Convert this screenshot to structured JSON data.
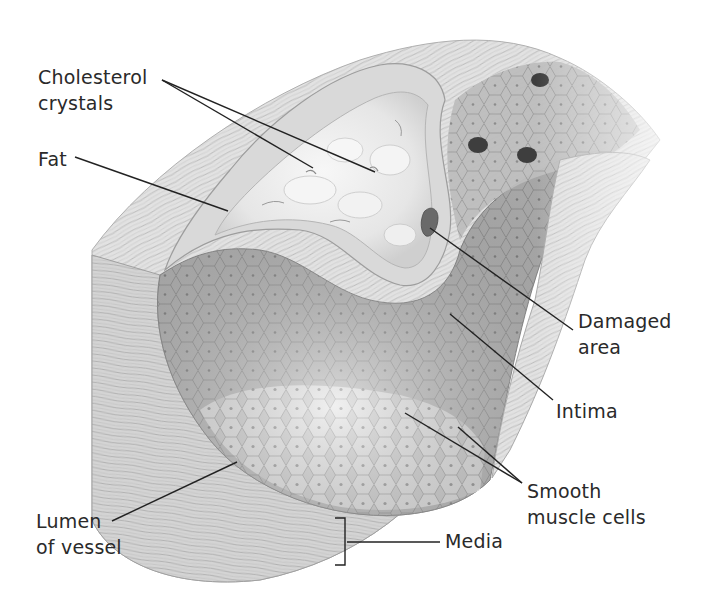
{
  "diagram": {
    "colors": {
      "background": "#ffffff",
      "ink": "#2a2a2a",
      "wall_light": "#e4e4e4",
      "wall_mid": "#c8c8c8",
      "wall_dark": "#9a9a9a",
      "lumen": "#b9b9b9",
      "lumen_light": "#d6d6d6",
      "plaque": "#eeeeee",
      "damaged": "#6a6a6a",
      "cell_dark": "#555555"
    },
    "labels": [
      {
        "id": "cholesterol-crystals",
        "lines": [
          "Cholesterol",
          "crystals"
        ],
        "x": 38,
        "y": 64,
        "leaders": [
          [
            162,
            80,
            313,
            168
          ],
          [
            162,
            80,
            375,
            172
          ]
        ]
      },
      {
        "id": "fat",
        "lines": [
          "Fat"
        ],
        "x": 38,
        "y": 146,
        "leaders": [
          [
            75,
            157,
            228,
            211
          ]
        ]
      },
      {
        "id": "damaged-area",
        "lines": [
          "Damaged",
          "area"
        ],
        "x": 578,
        "y": 308,
        "leaders": [
          [
            430,
            228,
            573,
            330
          ]
        ]
      },
      {
        "id": "intima",
        "lines": [
          "Intima"
        ],
        "x": 556,
        "y": 398,
        "leaders": [
          [
            450,
            314,
            553,
            400
          ]
        ]
      },
      {
        "id": "smooth-muscle-cells",
        "lines": [
          "Smooth",
          "muscle cells"
        ],
        "x": 527,
        "y": 478,
        "leaders": [
          [
            405,
            413,
            522,
            483
          ],
          [
            458,
            427,
            522,
            483
          ]
        ]
      },
      {
        "id": "lumen-of-vessel",
        "lines": [
          "Lumen",
          "of vessel"
        ],
        "x": 36,
        "y": 508,
        "leaders": [
          [
            237,
            462,
            112,
            521
          ]
        ]
      },
      {
        "id": "media",
        "lines": [
          "Media"
        ],
        "x": 445,
        "y": 528,
        "leaders": [
          [
            347,
            542,
            440,
            542
          ]
        ],
        "bracket": {
          "x": 345,
          "y1": 518,
          "y2": 565,
          "tick": 10
        }
      }
    ]
  }
}
